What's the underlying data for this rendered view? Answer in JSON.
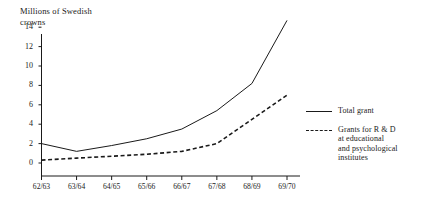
{
  "chart_data": {
    "type": "line",
    "title": "",
    "ylabel": "Millions of Swedish crowns",
    "xlabel": "",
    "categories": [
      "62/63",
      "63/64",
      "64/65",
      "65/66",
      "66/67",
      "67/68",
      "68/69",
      "69/70"
    ],
    "ylim": [
      0,
      15
    ],
    "yticks": [
      0,
      2,
      4,
      6,
      8,
      10,
      12,
      14
    ],
    "grid": false,
    "legend_position": "right",
    "series": [
      {
        "name": "Total grant",
        "style": "solid",
        "color": "#1a1a1a",
        "values": [
          2.0,
          1.2,
          1.8,
          2.5,
          3.5,
          5.4,
          8.2,
          14.7
        ]
      },
      {
        "name": "Grants for R & D\nat educational\nand psychological\ninstitutes",
        "style": "dashed",
        "color": "#1a1a1a",
        "values": [
          0.3,
          0.5,
          0.7,
          0.9,
          1.2,
          2.0,
          4.5,
          7.0
        ]
      }
    ]
  },
  "axis": {
    "y_title_line1": "Millions of Swedish",
    "y_title_line2": "crowns",
    "yticks": [
      "14",
      "12",
      "10",
      "8",
      "6",
      "4",
      "2",
      "0"
    ],
    "xticks": [
      "62/63",
      "63/64",
      "64/65",
      "65/66",
      "66/67",
      "67/68",
      "68/69",
      "69/70"
    ]
  },
  "legend": {
    "entries": [
      {
        "label": "Total grant"
      },
      {
        "label": "Grants for R & D\nat educational\nand psychological\ninstitutes"
      }
    ]
  }
}
